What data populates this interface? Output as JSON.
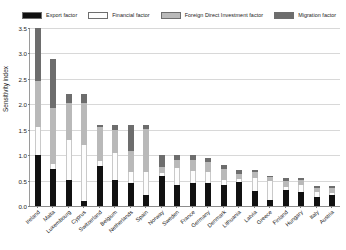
{
  "legend": {
    "items": [
      {
        "label": "Export factor",
        "color": "#111111"
      },
      {
        "label": "Financial factor",
        "color": "#fdfdfd"
      },
      {
        "label": "Foreign Direct Investment factor",
        "color": "#b9b9b9"
      },
      {
        "label": "Migration factor",
        "color": "#6d6d6d"
      }
    ]
  },
  "axes": {
    "ylabel": "Sensitivity index",
    "yticks": [
      "0.0",
      "0.5",
      "1.0",
      "1.5",
      "2.0",
      "2.5",
      "3.0",
      "3.5"
    ]
  },
  "chart_data": {
    "type": "bar",
    "title": "",
    "xlabel": "",
    "ylabel": "Sensitivity index",
    "ylim": [
      0.0,
      3.5
    ],
    "grid": true,
    "stacked": true,
    "legend_position": "top",
    "categories": [
      "Ireland",
      "Malta",
      "Luxembourg",
      "Cyprus",
      "Switzerland",
      "Belgium",
      "Netherlands",
      "Spain",
      "Norway",
      "Sweden",
      "France",
      "Germany",
      "Denmark",
      "Lithuania",
      "Latvia",
      "Greece",
      "Finland",
      "Hungary",
      "Italy",
      "Austria"
    ],
    "series": [
      {
        "name": "Export factor",
        "color": "#111111",
        "values": [
          1.0,
          0.72,
          0.52,
          0.1,
          0.78,
          0.52,
          0.46,
          0.22,
          0.6,
          0.42,
          0.46,
          0.45,
          0.42,
          0.48,
          0.3,
          0.12,
          0.32,
          0.28,
          0.18,
          0.22
        ]
      },
      {
        "name": "Financial factor",
        "color": "#fdfdfd",
        "values": [
          0.55,
          0.1,
          0.78,
          1.1,
          0.1,
          0.52,
          0.2,
          0.45,
          0.05,
          0.32,
          0.22,
          0.22,
          0.1,
          0.06,
          0.26,
          0.38,
          0.06,
          0.14,
          0.1,
          0.04
        ]
      },
      {
        "name": "Foreign Direct Investment factor",
        "color": "#b9b9b9",
        "values": [
          0.9,
          1.1,
          0.72,
          0.82,
          0.68,
          0.46,
          0.42,
          0.85,
          0.12,
          0.16,
          0.22,
          0.2,
          0.2,
          0.08,
          0.1,
          0.08,
          0.12,
          0.1,
          0.08,
          0.1
        ],
        "short_name": "FDI factor"
      },
      {
        "name": "Migration factor",
        "color": "#6d6d6d",
        "values": [
          1.05,
          0.98,
          0.18,
          0.18,
          0.04,
          0.1,
          0.52,
          0.08,
          0.23,
          0.1,
          0.1,
          0.08,
          0.08,
          0.08,
          0.04,
          0.02,
          0.05,
          0.03,
          0.04,
          0.04
        ]
      }
    ],
    "totals": [
      3.5,
      2.9,
      2.2,
      2.2,
      1.6,
      1.6,
      1.6,
      1.6,
      1.0,
      1.0,
      1.0,
      0.95,
      0.8,
      0.7,
      0.7,
      0.6,
      0.55,
      0.55,
      0.4,
      0.4
    ]
  }
}
